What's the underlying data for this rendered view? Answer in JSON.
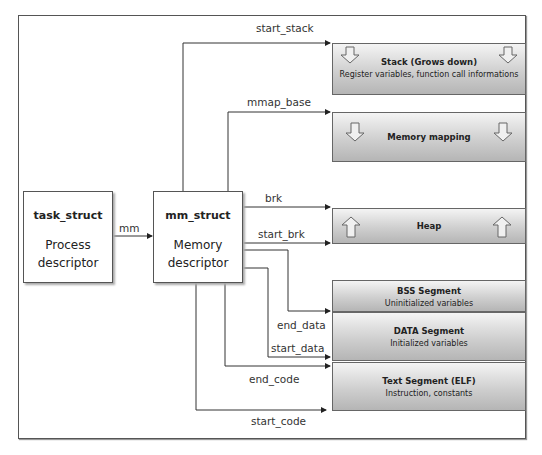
{
  "diagram": {
    "task_struct": {
      "title": "task_struct",
      "subtitle_line1": "Process",
      "subtitle_line2": "descriptor"
    },
    "mm_struct": {
      "title": "mm_struct",
      "subtitle_line1": "Memory",
      "subtitle_line2": "descriptor"
    },
    "edge_mm": "mm",
    "pointers": {
      "start_stack": "start_stack",
      "mmap_base": "mmap_base",
      "brk": "brk",
      "start_brk": "start_brk",
      "end_data": "end_data",
      "start_data": "start_data",
      "end_code": "end_code",
      "start_code": "start_code"
    },
    "segments": [
      {
        "title": "Stack (Grows down)",
        "subtitle": "Register variables, function call informations",
        "arrows": "down-arrow"
      },
      {
        "title": "Memory mapping",
        "subtitle": "",
        "arrows": "down-arrow"
      },
      {
        "title": "Heap",
        "subtitle": "",
        "arrows": "up-arrow"
      },
      {
        "title": "BSS Segment",
        "subtitle": "Uninitialized variables"
      },
      {
        "title": "DATA Segment",
        "subtitle": "Initialized variables"
      },
      {
        "title": "Text Segment (ELF)",
        "subtitle": "Instruction, constants"
      }
    ]
  }
}
